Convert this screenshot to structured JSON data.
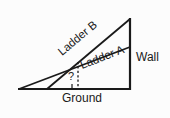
{
  "figure": {
    "kind": "crossed-ladders-geometry-diagram",
    "background_color": "#fcfcfc",
    "stroke_color": "#1a1a1a",
    "labels": {
      "ladder_b": "Ladder B",
      "ladder_a": "Ladder A",
      "wall": "Wall",
      "ground": "Ground",
      "unknown_height": "?"
    },
    "annotations": {
      "right_angle_marker": "right-angle",
      "dashed_segment": "unknown crossing height"
    }
  }
}
